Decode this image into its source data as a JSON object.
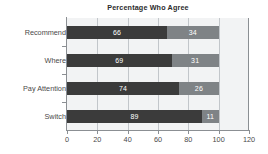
{
  "chart_data": {
    "type": "bar",
    "orientation": "horizontal",
    "stacked": true,
    "title": "Percentage Who Agree",
    "xlabel": "",
    "ylabel": "",
    "categories": [
      "Recommend",
      "Where",
      "Pay Attention",
      "Switch"
    ],
    "series": [
      {
        "name": "Agree",
        "color": "#3b3b3b",
        "values": [
          66,
          69,
          74,
          89
        ]
      },
      {
        "name": "Disagree",
        "color": "#7f8386",
        "values": [
          34,
          31,
          26,
          11
        ]
      }
    ],
    "xticks": [
      0,
      20,
      40,
      60,
      80,
      100,
      120
    ],
    "xlim": [
      0,
      120
    ],
    "grid": true,
    "legend": "none",
    "bar_labels": [
      [
        "66",
        "34"
      ],
      [
        "69",
        "31"
      ],
      [
        "74",
        "26"
      ],
      [
        "89",
        "11"
      ]
    ]
  },
  "colors": {
    "plot_background": "#f2f3f4",
    "gridline": "#c2c6ca",
    "axis": "#8b8f93",
    "tick_text": "#4a4a4a",
    "title_text": "#2b2b2b",
    "bar_label_text": "#ffffff",
    "page_background": "#ffffff"
  }
}
